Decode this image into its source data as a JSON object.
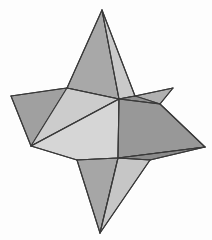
{
  "figure": {
    "background_color": "#fdfdfd",
    "edge_color": "#3a3a3a",
    "edge_width": 1.1,
    "canvas": {
      "width": 212,
      "height": 240
    },
    "palette": {
      "light": "#dcdcdc",
      "light_mid": "#cfcfcf",
      "mid": "#b4b4b4",
      "mid_dark": "#a3a3a3",
      "dark": "#949494",
      "darker": "#8a8a8a"
    },
    "vertices": {
      "top_spike_tip": [
        102,
        10
      ],
      "left_spike_tip": [
        11,
        96
      ],
      "upper_right_spike_tip": [
        173,
        88
      ],
      "right_spike_tip": [
        205,
        147
      ],
      "bottom_spike_tip": [
        100,
        233
      ],
      "hub_center": [
        119,
        99
      ],
      "hub_lower": [
        118,
        158
      ],
      "left_waist": [
        31,
        146
      ],
      "top_base_left": [
        67,
        88
      ],
      "top_base_right": [
        135,
        96
      ],
      "left_upper_rim": [
        59,
        89
      ],
      "right_rim": [
        160,
        104
      ],
      "bottom_left_rim": [
        77,
        160
      ],
      "bottom_right_rim": [
        150,
        160
      ]
    },
    "faces": [
      {
        "name": "top-spike-left-face",
        "shade": "mid",
        "fill": "#a8a8a8",
        "points": "102,10 67,88 119,99"
      },
      {
        "name": "top-spike-right-face",
        "shade": "light_mid",
        "fill": "#c9c9c9",
        "points": "102,10 119,99 135,96"
      },
      {
        "name": "upper-left-wing-top",
        "shade": "mid_dark",
        "fill": "#a0a0a0",
        "points": "11,96 59,89 67,88 31,146"
      },
      {
        "name": "upper-left-wing-inner",
        "shade": "light",
        "fill": "#cccccc",
        "points": "67,88 119,99 31,146"
      },
      {
        "name": "left-lower-wing",
        "shade": "light",
        "fill": "#d6d6d6",
        "points": "31,146 119,99 118,158 77,160"
      },
      {
        "name": "upper-right-wing",
        "shade": "mid",
        "fill": "#b0b0b0",
        "points": "135,96 173,88 160,104"
      },
      {
        "name": "upper-right-wing-under",
        "shade": "dark",
        "fill": "#8f8f8f",
        "points": "119,99 135,96 160,104"
      },
      {
        "name": "right-wing-top",
        "shade": "dark",
        "fill": "#989898",
        "points": "119,99 160,104 205,147 118,158"
      },
      {
        "name": "right-wing-lower",
        "shade": "darker",
        "fill": "#8b8b8b",
        "points": "118,158 205,147 150,160"
      },
      {
        "name": "bottom-spike-left-face",
        "shade": "mid",
        "fill": "#a6a6a6",
        "points": "77,160 118,158 100,233"
      },
      {
        "name": "bottom-spike-right-face",
        "shade": "light_mid",
        "fill": "#c6c6c6",
        "points": "118,158 150,160 100,233"
      }
    ],
    "edges": [
      {
        "name": "edge-top-tip-to-hub",
        "points": "102,10 119,99"
      },
      {
        "name": "edge-top-tip-to-base-left",
        "points": "102,10 67,88"
      },
      {
        "name": "edge-top-tip-to-base-right",
        "points": "102,10 135,96"
      },
      {
        "name": "edge-hub-to-base-left",
        "points": "119,99 67,88"
      },
      {
        "name": "edge-hub-to-base-right",
        "points": "119,99 135,96"
      },
      {
        "name": "edge-left-tip-upper",
        "points": "11,96 67,88"
      },
      {
        "name": "edge-left-tip-lower",
        "points": "11,96 31,146"
      },
      {
        "name": "edge-waist-to-hub",
        "points": "31,146 119,99"
      },
      {
        "name": "edge-waist-to-bottom-left-rim",
        "points": "31,146 77,160"
      },
      {
        "name": "edge-bottom-left-rim-to-hub-lower",
        "points": "77,160 118,158"
      },
      {
        "name": "edge-hub-to-hub-lower",
        "points": "119,99 118,158"
      },
      {
        "name": "edge-right-rim-to-upper-right-tip",
        "points": "160,104 173,88"
      },
      {
        "name": "edge-upper-right-tip-to-base-right",
        "points": "173,88 135,96"
      },
      {
        "name": "edge-hub-to-right-rim",
        "points": "119,99 160,104"
      },
      {
        "name": "edge-right-rim-to-right-tip",
        "points": "160,104 205,147"
      },
      {
        "name": "edge-right-tip-to-hub-lower",
        "points": "205,147 118,158"
      },
      {
        "name": "edge-right-tip-to-bottom-right-rim",
        "points": "205,147 150,160"
      },
      {
        "name": "edge-hub-lower-to-bottom-right-rim",
        "points": "118,158 150,160"
      },
      {
        "name": "edge-bottom-tip-left",
        "points": "100,233 77,160"
      },
      {
        "name": "edge-bottom-tip-hub",
        "points": "100,233 118,158"
      },
      {
        "name": "edge-bottom-tip-right",
        "points": "100,233 150,160"
      }
    ]
  }
}
